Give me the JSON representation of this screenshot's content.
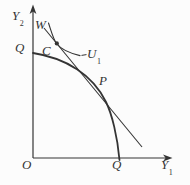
{
  "figure": {
    "type": "economics-diagram",
    "axes": {
      "y": {
        "base": "Y",
        "sub": "2"
      },
      "x": {
        "base": "Y",
        "sub": "1"
      },
      "origin_label": "O"
    },
    "labels": {
      "q_on_y_axis": "Q",
      "q_on_x_axis": "Q",
      "w": "W",
      "c": "C",
      "p": "P",
      "u1": {
        "base": "U",
        "sub": "1"
      }
    },
    "curves": [
      {
        "name": "production-possibility-frontier",
        "shape": "concave",
        "endpoints": [
          "Q on Y2 axis",
          "Q on Y1 axis"
        ]
      },
      {
        "name": "price-line",
        "shape": "straight",
        "through": [
          "C",
          "P"
        ]
      },
      {
        "name": "indifference-curve",
        "shape": "convex",
        "tangent_at": "C",
        "label": "U1"
      }
    ],
    "points": [
      {
        "label": "C",
        "marker": "filled-dot"
      },
      {
        "label": "P",
        "marker": "none"
      }
    ]
  },
  "colors": {
    "ink": "#343434",
    "background": "#fcfcfc"
  }
}
